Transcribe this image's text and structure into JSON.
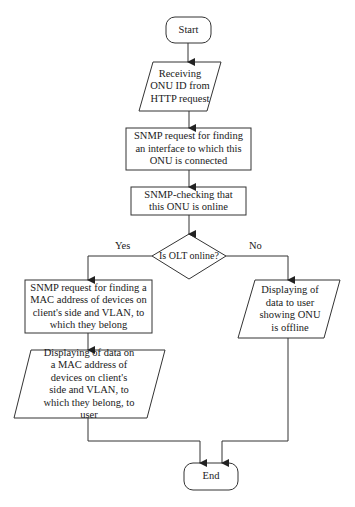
{
  "diagram": {
    "type": "flowchart",
    "nodes": {
      "start": {
        "shape": "terminator",
        "label": "Start"
      },
      "receive": {
        "shape": "input-output",
        "label": "Receiving ONU ID from HTTP request"
      },
      "snmp_interface": {
        "shape": "process",
        "label": "SNMP request for finding an interface to which this ONU is connected"
      },
      "snmp_check": {
        "shape": "process",
        "label": "SNMP-checking that this ONU is online"
      },
      "decision": {
        "shape": "decision",
        "label": "Is OLT online?"
      },
      "snmp_mac": {
        "shape": "process",
        "label": "SNMP request for finding a MAC address of devices on client's side and VLAN, to which they belong"
      },
      "display_mac": {
        "shape": "input-output",
        "label": "Displaying of data on a MAC address of devices on client's side and VLAN, to which they belong, to user"
      },
      "display_offline": {
        "shape": "input-output",
        "label": "Displaying of data to user showing ONU is offline"
      },
      "end": {
        "shape": "terminator",
        "label": "End"
      }
    },
    "edges": {
      "yes": {
        "from": "decision",
        "to": "snmp_mac",
        "label": "Yes"
      },
      "no": {
        "from": "decision",
        "to": "display_offline",
        "label": "No"
      }
    },
    "colors": {
      "stroke": "#333333",
      "fill": "#ffffff",
      "text": "#1a1a1a"
    }
  }
}
